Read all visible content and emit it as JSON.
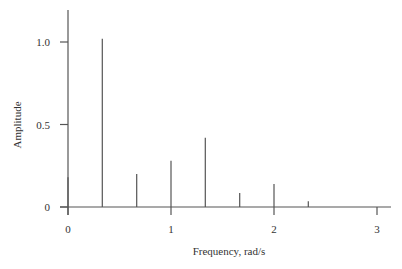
{
  "chart_data": {
    "type": "bar",
    "subtype": "stem",
    "title": "",
    "xlabel": "Frequency, rad/s",
    "ylabel": "Amplitude",
    "xlim": [
      0,
      3.1
    ],
    "ylim": [
      0,
      1.2
    ],
    "xticks": [
      0,
      1,
      2,
      3
    ],
    "xtick_labels": [
      "0",
      "1",
      "2",
      "3"
    ],
    "yticks": [
      0,
      0.5,
      1.0
    ],
    "ytick_labels": [
      "0",
      "0.5",
      "1.0"
    ],
    "grid": false,
    "legend": null,
    "x": [
      0,
      0.333,
      0.667,
      1.0,
      1.333,
      1.667,
      2.0,
      2.333
    ],
    "values": [
      0.18,
      1.02,
      0.2,
      0.28,
      0.42,
      0.085,
      0.14,
      0.035
    ],
    "color": "#555555"
  },
  "layout": {
    "origin_px": [
      68,
      207
    ],
    "x_px_per_unit": 103,
    "y_px_per_unit": 165,
    "y_axis_top_px": 10,
    "x_axis_right_px": 391
  }
}
